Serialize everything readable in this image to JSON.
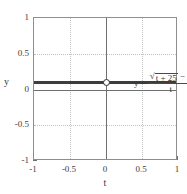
{
  "chart_data": {
    "type": "line",
    "title": "",
    "subtitle": "",
    "xlabel": "t",
    "ylabel": "y",
    "xlim": [
      -1,
      1
    ],
    "ylim": [
      -1,
      1
    ],
    "grid": true,
    "legend": null,
    "x_ticks": [
      "-1",
      "-0.5",
      "0",
      "0.5",
      "1"
    ],
    "x_tick_values": [
      -1,
      -0.5,
      0,
      0.5,
      1
    ],
    "y_ticks": [
      "1",
      "0.5",
      "0",
      "-0.5",
      "-1"
    ],
    "y_tick_values": [
      1,
      0.5,
      0,
      -0.5,
      -1
    ],
    "series": [
      {
        "name": "y = (sqrt(t + 25) - 5) / t",
        "x": [
          -1,
          -0.75,
          -0.5,
          -0.25,
          0.25,
          0.5,
          0.75,
          1
        ],
        "values": [
          0.1005,
          0.1003,
          0.1001,
          0.1,
          0.0999,
          0.0998,
          0.0997,
          0.0995
        ],
        "style": "solid",
        "color": "#3d3d3d"
      }
    ],
    "discontinuity": {
      "type": "open-circle",
      "x": 0,
      "y": 0.1,
      "label": "removable discontinuity at t = 0"
    },
    "annotations": [
      {
        "name": "function-equation",
        "lhs": "y =",
        "numerator_radical_symbol": "√",
        "numerator_radicand": "t + 25",
        "numerator_suffix": "− 5",
        "denominator": "t",
        "x": 0.05,
        "y": 0.34
      }
    ]
  },
  "axes": {
    "y_label": "y",
    "x_label": "t",
    "y_ticks": [
      {
        "label": "1",
        "value": 1
      },
      {
        "label": "0.5",
        "value": 0.5
      },
      {
        "label": "0",
        "value": 0
      },
      {
        "label": "-0.5",
        "value": -0.5
      },
      {
        "label": "-1",
        "value": -1
      }
    ],
    "x_ticks": [
      {
        "label": "-1",
        "value": -1
      },
      {
        "label": "-0.5",
        "value": -0.5
      },
      {
        "label": "0",
        "value": 0
      },
      {
        "label": "0.5",
        "value": 0.5
      },
      {
        "label": "1",
        "value": 1
      }
    ]
  },
  "equation": {
    "lhs": "y =",
    "radical_symbol": "√",
    "radicand": "t + 25",
    "numerator_suffix": "− 5",
    "denominator": "t"
  },
  "colors": {
    "curve": "#3d3d3d",
    "axis": "#6f6f6f",
    "grid": "#c2c2c2",
    "frame": "#8e8e8e",
    "text": "#3a3a3a",
    "background": "#ffffff"
  }
}
